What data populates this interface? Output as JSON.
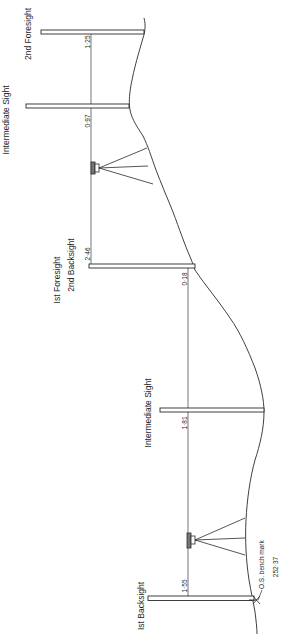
{
  "figure": {
    "labels": {
      "first_backsight": "Ist Backsight",
      "intermediate_sight_1": "Intermediate Sight",
      "first_foresight": "Ist Foresight",
      "second_backsight": "2nd Backsight",
      "intermediate_sight_2": "Intermediate Sight",
      "second_foresight": "2nd Foresight"
    },
    "readings": {
      "first_backsight": "1·55",
      "intermediate_sight_1": "1·81",
      "first_foresight": "0·18",
      "second_backsight": "2·46",
      "intermediate_sight_2": "0·97",
      "second_foresight": "1·25"
    },
    "bench_mark": {
      "label": "O.S. bench mark",
      "value": "252·37"
    }
  }
}
